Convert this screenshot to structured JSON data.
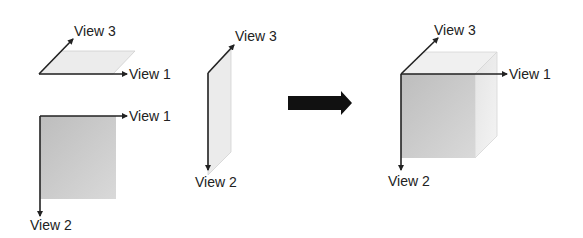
{
  "diagram": {
    "type": "view-composition",
    "colors": {
      "axis": "#222222",
      "plane_light": "#ececec",
      "plane_mid": "#d6d6d6",
      "face_front": "#c4c4c4",
      "face_side": "#ebebeb",
      "face_top": "#f0f0f0",
      "arrow": "#111111"
    },
    "panels": [
      {
        "id": "top-plane",
        "labels": {
          "view3": "View 3",
          "view1": "View 1"
        }
      },
      {
        "id": "front-plane",
        "labels": {
          "view1": "View 1",
          "view2": "View 2"
        }
      },
      {
        "id": "side-plane",
        "labels": {
          "view3": "View 3",
          "view2": "View 2"
        }
      },
      {
        "id": "combined-cube",
        "labels": {
          "view3": "View 3",
          "view1": "View 1",
          "view2": "View 2"
        }
      }
    ],
    "transition_arrow": "right-arrow"
  }
}
